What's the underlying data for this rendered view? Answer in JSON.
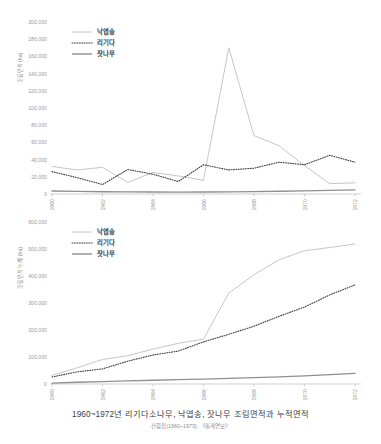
{
  "caption": {
    "title": "1960~1972년 리기다소나무, 낙엽송, 잣나무 조림면적과 누적면적",
    "source": "산림청(1960~1973), 《통계연보》"
  },
  "colors": {
    "nakyeopsong": "#bfbfbf",
    "rigida": "#3f3f3f",
    "jatnamu": "#8f8f8f",
    "axis": "#cfcfcf",
    "tick_text": "#9a9a9a",
    "legend_text": "#3a3a3a"
  },
  "chart_data": [
    {
      "type": "line",
      "id": "annual-afforestation-area",
      "title": "",
      "xlabel": "",
      "ylabel": "조림면적 (ha)",
      "x": [
        1960,
        1961,
        1962,
        1963,
        1964,
        1965,
        1966,
        1967,
        1968,
        1969,
        1970,
        1971,
        1972
      ],
      "xticks": [
        "1960",
        "1962",
        "1964",
        "1966",
        "1968",
        "1970",
        "1972"
      ],
      "ylim": [
        0,
        200000
      ],
      "yticks": [
        0,
        20000,
        40000,
        60000,
        80000,
        100000,
        120000,
        140000,
        160000,
        180000,
        200000
      ],
      "ytick_labels": [
        "0",
        "20,000",
        "40,000",
        "60,000",
        "80,000",
        "100,000",
        "120,000",
        "140,000",
        "160,000",
        "180,000",
        "200,000"
      ],
      "grid": false,
      "legend_position": "top-left",
      "series": [
        {
          "name": "낙엽송",
          "style": "solid",
          "color": "#bfbfbf",
          "values": [
            32000,
            28000,
            31000,
            13500,
            25000,
            21000,
            16000,
            170000,
            68000,
            56000,
            33000,
            12000,
            13000
          ]
        },
        {
          "name": "리기다",
          "style": "dotted",
          "color": "#3f3f3f",
          "values": [
            26000,
            19000,
            11000,
            28500,
            23000,
            14500,
            34000,
            28000,
            30000,
            37000,
            34000,
            45000,
            37000
          ]
        },
        {
          "name": "잣나무",
          "style": "solid-thick",
          "color": "#8f8f8f",
          "values": [
            3500,
            3000,
            2600,
            2400,
            2300,
            2100,
            2300,
            2500,
            2800,
            3200,
            3600,
            4200,
            4800
          ]
        }
      ]
    },
    {
      "type": "line",
      "id": "cumulative-afforestation-area",
      "title": "",
      "xlabel": "",
      "ylabel": "조림면적 누계 (ha)",
      "x": [
        1960,
        1961,
        1962,
        1963,
        1964,
        1965,
        1966,
        1967,
        1968,
        1969,
        1970,
        1971,
        1972
      ],
      "xticks": [
        "1960",
        "1962",
        "1964",
        "1966",
        "1968",
        "1970",
        "1972"
      ],
      "ylim": [
        0,
        600000
      ],
      "yticks": [
        0,
        100000,
        200000,
        300000,
        400000,
        500000,
        600000
      ],
      "ytick_labels": [
        "0",
        "100,000",
        "200,000",
        "300,000",
        "400,000",
        "500,000",
        "600,000"
      ],
      "grid": false,
      "legend_position": "top-left",
      "series": [
        {
          "name": "낙엽송",
          "style": "solid",
          "color": "#bfbfbf",
          "values": [
            32000,
            60000,
            91000,
            104500,
            129500,
            150500,
            166500,
            336500,
            404500,
            460500,
            493500,
            505500,
            518500
          ]
        },
        {
          "name": "리기다",
          "style": "dotted",
          "color": "#3f3f3f",
          "values": [
            26000,
            45000,
            56000,
            84500,
            107500,
            122000,
            156000,
            184000,
            214000,
            251000,
            285000,
            330000,
            367000
          ]
        },
        {
          "name": "잣나무",
          "style": "solid-thick",
          "color": "#8f8f8f",
          "values": [
            3500,
            6500,
            9100,
            11500,
            13800,
            15900,
            18200,
            20700,
            23500,
            26700,
            30300,
            34500,
            39300
          ]
        }
      ]
    }
  ]
}
